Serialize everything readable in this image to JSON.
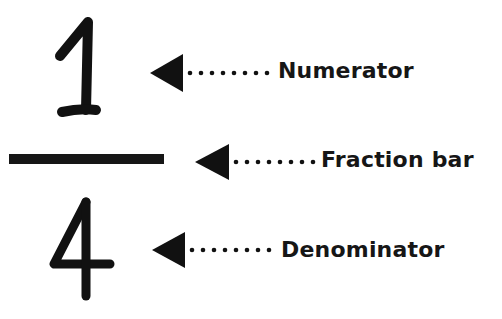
{
  "diagram": {
    "numerator_value": "1",
    "denominator_value": "4",
    "labels": {
      "numerator": "Numerator",
      "fraction_bar": "Fraction bar",
      "denominator": "Denominator"
    },
    "colors": {
      "ink": "#161616",
      "background": "#ffffff"
    }
  }
}
